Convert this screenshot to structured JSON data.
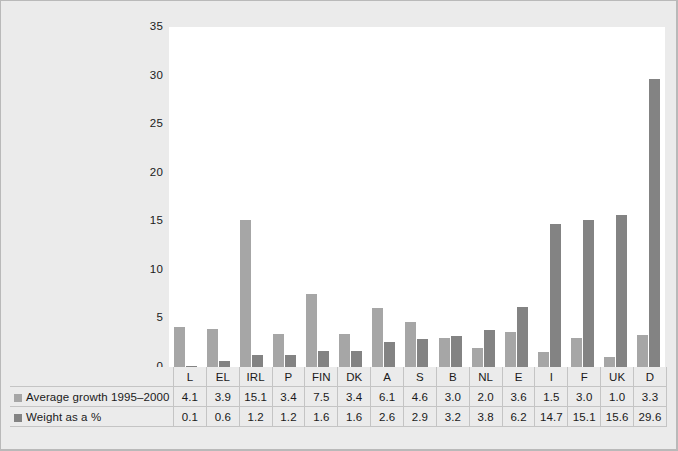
{
  "chart_data": {
    "type": "bar",
    "title": "",
    "subtitle": "",
    "xlabel": "",
    "ylabel": "",
    "ylim": [
      0,
      35
    ],
    "yticks": [
      0,
      5,
      10,
      15,
      20,
      25,
      30,
      35
    ],
    "grid": false,
    "legend_position": "table-below",
    "categories": [
      "L",
      "EL",
      "IRL",
      "P",
      "FIN",
      "DK",
      "A",
      "S",
      "B",
      "NL",
      "E",
      "I",
      "F",
      "UK",
      "D"
    ],
    "series": [
      {
        "name": "Average growth 1995–2000",
        "color": "#a6a6a6",
        "values": [
          4.1,
          3.9,
          15.1,
          3.4,
          7.5,
          3.4,
          6.1,
          4.6,
          3.0,
          2.0,
          3.6,
          1.5,
          3.0,
          1.0,
          3.3
        ]
      },
      {
        "name": "Weight as a %",
        "color": "#838383",
        "values": [
          0.1,
          0.6,
          1.2,
          1.2,
          1.6,
          1.6,
          2.6,
          2.9,
          3.2,
          3.8,
          6.2,
          14.7,
          15.1,
          15.6,
          29.6
        ]
      }
    ]
  },
  "colors": {
    "figure_background": "#ebebeb",
    "plot_background": "#ffffff",
    "frame_border": "#b9b9b9",
    "table_grid": "#c4c4c4",
    "series_growth": "#a6a6a6",
    "series_weight": "#838383",
    "text": "#1a1a1a"
  }
}
